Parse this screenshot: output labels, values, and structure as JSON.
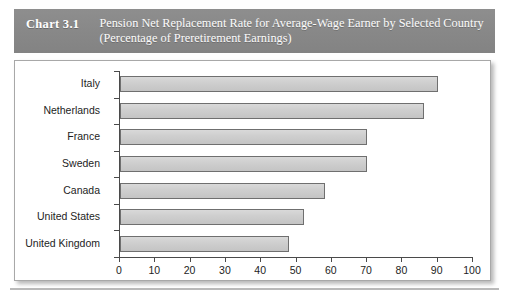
{
  "header": {
    "chart_number": "Chart 3.1",
    "title": "Pension Net Replacement Rate for Average-Wage Earner by Selected Country (Percentage of Preretirement Earnings)",
    "band_color": "#888888",
    "text_color": "#ffffff"
  },
  "chart_data": {
    "type": "bar",
    "orientation": "horizontal",
    "title": "Pension Net Replacement Rate for Average-Wage Earner by Selected Country (Percentage of Preretirement Earnings)",
    "categories": [
      "Italy",
      "Netherlands",
      "France",
      "Sweden",
      "Canada",
      "United States",
      "United Kingdom"
    ],
    "values": [
      90,
      86,
      70,
      70,
      58,
      52,
      48
    ],
    "xlabel": "",
    "ylabel": "",
    "xlim": [
      0,
      100
    ],
    "xticks": [
      0,
      10,
      20,
      30,
      40,
      50,
      60,
      70,
      80,
      90,
      100
    ],
    "xtick_labels": [
      "0",
      "10",
      "20",
      "30",
      "40",
      "50",
      "60",
      "70",
      "80",
      "90",
      "100"
    ],
    "grid": false,
    "legend": null,
    "bar_fill_color": "#cfcfcf",
    "bar_border_color": "#6f6f6f",
    "axis_color": "#4a4a4a",
    "plot_background": "#ffffff"
  }
}
